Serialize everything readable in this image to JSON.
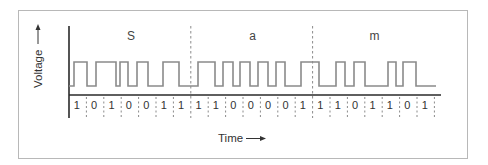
{
  "diagram": {
    "type": "digital-signal-waveform",
    "y_axis_label": "Voltage",
    "x_axis_label": "Time",
    "characters": [
      {
        "label": "S",
        "bits": [
          "1",
          "0",
          "1",
          "0",
          "0",
          "1",
          "1"
        ]
      },
      {
        "label": "a",
        "bits": [
          "1",
          "1",
          "0",
          "0",
          "0",
          "0",
          "1"
        ]
      },
      {
        "label": "m",
        "bits": [
          "1",
          "1",
          "0",
          "1",
          "1",
          "0",
          "1"
        ]
      }
    ],
    "bit_sequence": [
      "1",
      "0",
      "1",
      "0",
      "0",
      "1",
      "1",
      "1",
      "1",
      "0",
      "0",
      "0",
      "0",
      "1",
      "1",
      "1",
      "0",
      "1",
      "1",
      "0",
      "1"
    ],
    "waveform_transitions_x": [
      74,
      87,
      96,
      116,
      120,
      128,
      137,
      148,
      163,
      179,
      198,
      215,
      223,
      233,
      240,
      250,
      258,
      268,
      276,
      285,
      301,
      319,
      336,
      345,
      354,
      365,
      388,
      396,
      403,
      416
    ],
    "waveform_start_level": "low",
    "colors": {
      "frame": "#b8b8b8",
      "axis": "#2a2a2a",
      "waveform": "#8a8a8a",
      "text": "#333333"
    }
  }
}
